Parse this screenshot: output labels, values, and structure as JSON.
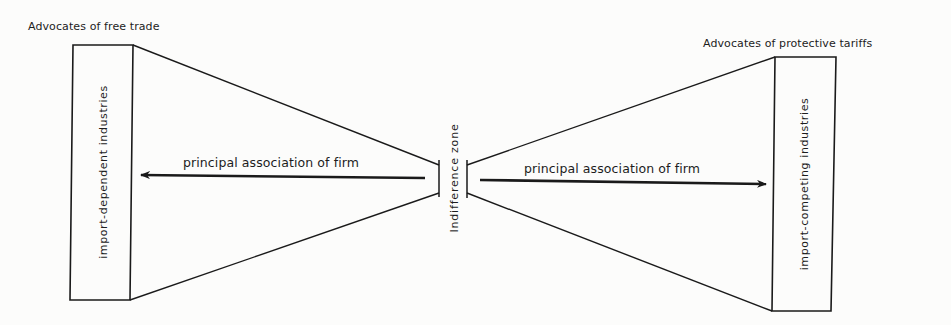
{
  "diagram": {
    "left": {
      "group_title": "Advocates of free trade",
      "box_label": "import-dependent industries",
      "arrow_label": "principal association of firm",
      "arrow_direction": "left"
    },
    "center": {
      "zone_label": "Indifference zone"
    },
    "right": {
      "group_title": "Advocates of protective tariffs",
      "box_label": "import-competing industries",
      "arrow_label": "principal association of firm",
      "arrow_direction": "right"
    },
    "colors": {
      "background": "#fcfcfb",
      "ink": "#1a1a1a"
    }
  }
}
